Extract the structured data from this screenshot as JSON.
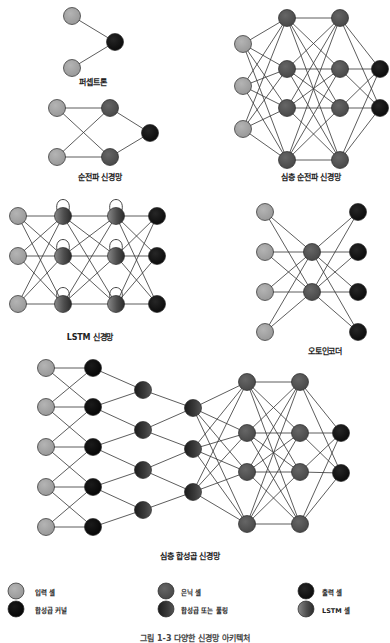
{
  "colors": {
    "input": "#a4a4a4",
    "hidden": "#555555",
    "output": "#151515",
    "kernel": "#0c0c0c",
    "pool": "#2e2e2e",
    "lstm": "#666666",
    "edge": "#333333",
    "stroke": "#333333"
  },
  "figures": [
    {
      "id": "perceptron",
      "label": "퍼셉트론",
      "label_pos": [
        93,
        80
      ],
      "nodes": [
        {
          "x": 72,
          "y": 16,
          "type": "input"
        },
        {
          "x": 72,
          "y": 68,
          "type": "input"
        },
        {
          "x": 115,
          "y": 42,
          "type": "output"
        }
      ],
      "layers": [
        [
          0,
          1
        ],
        [
          2
        ]
      ]
    },
    {
      "id": "feed-forward",
      "label": "순전파 신경망",
      "label_pos": [
        100,
        175
      ],
      "nodes": [
        {
          "x": 57,
          "y": 108,
          "type": "input"
        },
        {
          "x": 57,
          "y": 157,
          "type": "input"
        },
        {
          "x": 110,
          "y": 108,
          "type": "hidden"
        },
        {
          "x": 110,
          "y": 157,
          "type": "hidden"
        },
        {
          "x": 150,
          "y": 133,
          "type": "output"
        }
      ],
      "layers": [
        [
          0,
          1
        ],
        [
          2,
          3
        ],
        [
          4
        ]
      ]
    },
    {
      "id": "deep-feed-forward",
      "label": "심층 순전파 신경망",
      "label_pos": [
        311,
        174
      ],
      "nodes": [
        {
          "x": 243,
          "y": 44,
          "type": "input"
        },
        {
          "x": 243,
          "y": 86,
          "type": "input"
        },
        {
          "x": 243,
          "y": 129,
          "type": "input"
        },
        {
          "x": 287,
          "y": 18,
          "type": "hidden"
        },
        {
          "x": 287,
          "y": 69,
          "type": "hidden"
        },
        {
          "x": 287,
          "y": 108,
          "type": "hidden"
        },
        {
          "x": 287,
          "y": 160,
          "type": "hidden"
        },
        {
          "x": 340,
          "y": 18,
          "type": "hidden"
        },
        {
          "x": 340,
          "y": 69,
          "type": "hidden"
        },
        {
          "x": 340,
          "y": 108,
          "type": "hidden"
        },
        {
          "x": 340,
          "y": 160,
          "type": "hidden"
        },
        {
          "x": 380,
          "y": 69,
          "type": "output"
        },
        {
          "x": 380,
          "y": 108,
          "type": "output"
        }
      ],
      "layers": [
        [
          0,
          1,
          2
        ],
        [
          3,
          4,
          5,
          6
        ],
        [
          7,
          8,
          9,
          10
        ],
        [
          11,
          12
        ]
      ]
    },
    {
      "id": "lstm",
      "label": "LSTM 신경망",
      "label_pos": [
        90,
        337
      ],
      "nodes": [
        {
          "x": 18,
          "y": 216,
          "type": "input"
        },
        {
          "x": 18,
          "y": 256,
          "type": "input"
        },
        {
          "x": 18,
          "y": 304,
          "type": "input"
        },
        {
          "x": 63,
          "y": 216,
          "type": "lstm"
        },
        {
          "x": 63,
          "y": 256,
          "type": "lstm"
        },
        {
          "x": 63,
          "y": 304,
          "type": "lstm"
        },
        {
          "x": 116,
          "y": 216,
          "type": "lstm"
        },
        {
          "x": 116,
          "y": 256,
          "type": "lstm"
        },
        {
          "x": 116,
          "y": 304,
          "type": "lstm"
        },
        {
          "x": 157,
          "y": 216,
          "type": "output"
        },
        {
          "x": 157,
          "y": 256,
          "type": "output"
        },
        {
          "x": 157,
          "y": 304,
          "type": "output"
        }
      ],
      "layers": [
        [
          0,
          1,
          2
        ],
        [
          3,
          4,
          5
        ],
        [
          6,
          7,
          8
        ],
        [
          9,
          10,
          11
        ]
      ],
      "self_loops": [
        3,
        4,
        5,
        6,
        7,
        8
      ]
    },
    {
      "id": "autoencoder",
      "label": "오토인코더",
      "label_pos": [
        325,
        350
      ],
      "nodes": [
        {
          "x": 265,
          "y": 212,
          "type": "input"
        },
        {
          "x": 265,
          "y": 252,
          "type": "input"
        },
        {
          "x": 265,
          "y": 292,
          "type": "input"
        },
        {
          "x": 265,
          "y": 332,
          "type": "input"
        },
        {
          "x": 312,
          "y": 252,
          "type": "hidden"
        },
        {
          "x": 312,
          "y": 292,
          "type": "hidden"
        },
        {
          "x": 358,
          "y": 212,
          "type": "output"
        },
        {
          "x": 358,
          "y": 252,
          "type": "output"
        },
        {
          "x": 358,
          "y": 292,
          "type": "output"
        },
        {
          "x": 358,
          "y": 332,
          "type": "output"
        }
      ],
      "layers": [
        [
          0,
          1,
          2,
          3
        ],
        [
          4,
          5
        ],
        [
          6,
          7,
          8,
          9
        ]
      ]
    },
    {
      "id": "deep-convolutional",
      "label": "심층 합성곱 신경망",
      "label_pos": [
        190,
        554
      ],
      "nodes": [
        {
          "x": 46,
          "y": 368,
          "type": "input"
        },
        {
          "x": 46,
          "y": 407,
          "type": "input"
        },
        {
          "x": 46,
          "y": 447,
          "type": "input"
        },
        {
          "x": 46,
          "y": 487,
          "type": "input"
        },
        {
          "x": 46,
          "y": 527,
          "type": "input"
        },
        {
          "x": 93,
          "y": 368,
          "type": "kernel"
        },
        {
          "x": 93,
          "y": 407,
          "type": "kernel"
        },
        {
          "x": 93,
          "y": 447,
          "type": "kernel"
        },
        {
          "x": 93,
          "y": 487,
          "type": "kernel"
        },
        {
          "x": 93,
          "y": 527,
          "type": "kernel"
        },
        {
          "x": 143,
          "y": 390,
          "type": "pool"
        },
        {
          "x": 143,
          "y": 430,
          "type": "pool"
        },
        {
          "x": 143,
          "y": 470,
          "type": "pool"
        },
        {
          "x": 143,
          "y": 510,
          "type": "pool"
        },
        {
          "x": 193,
          "y": 408,
          "type": "pool"
        },
        {
          "x": 193,
          "y": 449,
          "type": "pool"
        },
        {
          "x": 193,
          "y": 492,
          "type": "pool"
        },
        {
          "x": 247,
          "y": 382,
          "type": "hidden"
        },
        {
          "x": 247,
          "y": 433,
          "type": "hidden"
        },
        {
          "x": 247,
          "y": 472,
          "type": "hidden"
        },
        {
          "x": 247,
          "y": 524,
          "type": "hidden"
        },
        {
          "x": 300,
          "y": 382,
          "type": "hidden"
        },
        {
          "x": 300,
          "y": 433,
          "type": "hidden"
        },
        {
          "x": 300,
          "y": 472,
          "type": "hidden"
        },
        {
          "x": 300,
          "y": 524,
          "type": "hidden"
        },
        {
          "x": 341,
          "y": 433,
          "type": "output"
        },
        {
          "x": 341,
          "y": 473,
          "type": "output"
        }
      ],
      "edges": [
        [
          0,
          5
        ],
        [
          0,
          6
        ],
        [
          1,
          5
        ],
        [
          1,
          6
        ],
        [
          1,
          7
        ],
        [
          2,
          6
        ],
        [
          2,
          7
        ],
        [
          2,
          8
        ],
        [
          3,
          7
        ],
        [
          3,
          8
        ],
        [
          3,
          9
        ],
        [
          4,
          8
        ],
        [
          4,
          9
        ],
        [
          5,
          10
        ],
        [
          6,
          10
        ],
        [
          6,
          11
        ],
        [
          7,
          11
        ],
        [
          7,
          12
        ],
        [
          8,
          12
        ],
        [
          8,
          13
        ],
        [
          9,
          13
        ],
        [
          10,
          14
        ],
        [
          11,
          14
        ],
        [
          11,
          15
        ],
        [
          12,
          15
        ],
        [
          12,
          16
        ],
        [
          13,
          16
        ]
      ],
      "dense_layers": [
        [
          14,
          15,
          16
        ],
        [
          17,
          18,
          19,
          20
        ],
        [
          21,
          22,
          23,
          24
        ],
        [
          25,
          26
        ]
      ]
    }
  ],
  "legend": [
    {
      "type": "input",
      "label": "입력 셀",
      "x": 16,
      "y": 591
    },
    {
      "type": "hidden",
      "label": "은닉 셀",
      "x": 166,
      "y": 591
    },
    {
      "type": "output",
      "label": "출력 셀",
      "x": 306,
      "y": 591
    },
    {
      "type": "kernel",
      "label": "합성곱 커널",
      "x": 16,
      "y": 609
    },
    {
      "type": "pool",
      "label": "합성곱 또는 풀링",
      "x": 166,
      "y": 609
    },
    {
      "type": "lstm",
      "label": "LSTM 셀",
      "x": 306,
      "y": 609
    }
  ],
  "caption": "그림 1-3 다양한 신경망 아키텍처"
}
